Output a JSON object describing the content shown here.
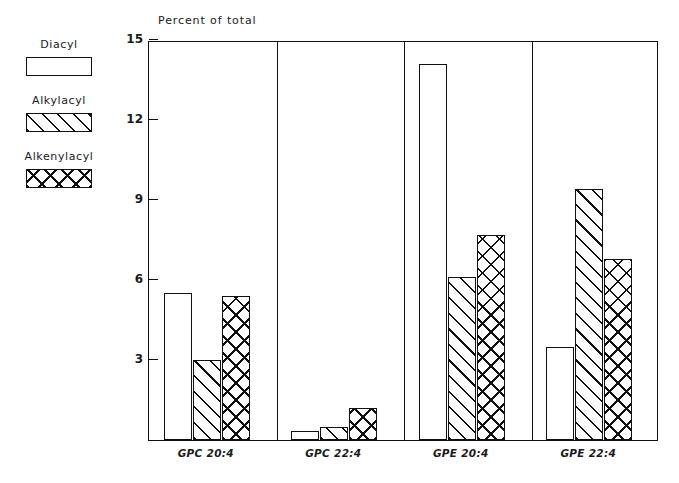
{
  "chart_data": {
    "type": "bar",
    "title": "Percent of total",
    "xlabel": "",
    "ylabel": "",
    "ylim": [
      0,
      15
    ],
    "yticks": [
      3,
      6,
      9,
      12,
      15
    ],
    "grid": false,
    "legend_position": "left",
    "categories": [
      "GPC 20:4",
      "GPC 22:4",
      "GPE 20:4",
      "GPE 22:4"
    ],
    "series": [
      {
        "name": "Diacyl",
        "pattern": "solid",
        "values": [
          5.5,
          0.35,
          14.1,
          3.5
        ]
      },
      {
        "name": "Alkylacyl",
        "pattern": "diagonal-hatch",
        "values": [
          3.0,
          0.5,
          6.1,
          9.4
        ]
      },
      {
        "name": "Alkenylacyl",
        "pattern": "cross-hatch",
        "values": [
          5.4,
          1.2,
          7.7,
          6.8
        ]
      }
    ]
  },
  "legend": {
    "items": [
      {
        "label": "Diacyl"
      },
      {
        "label": "Alkylacyl"
      },
      {
        "label": "Alkenylacyl"
      }
    ]
  },
  "colors": {
    "ink": "#111111",
    "background": "#ffffff"
  }
}
